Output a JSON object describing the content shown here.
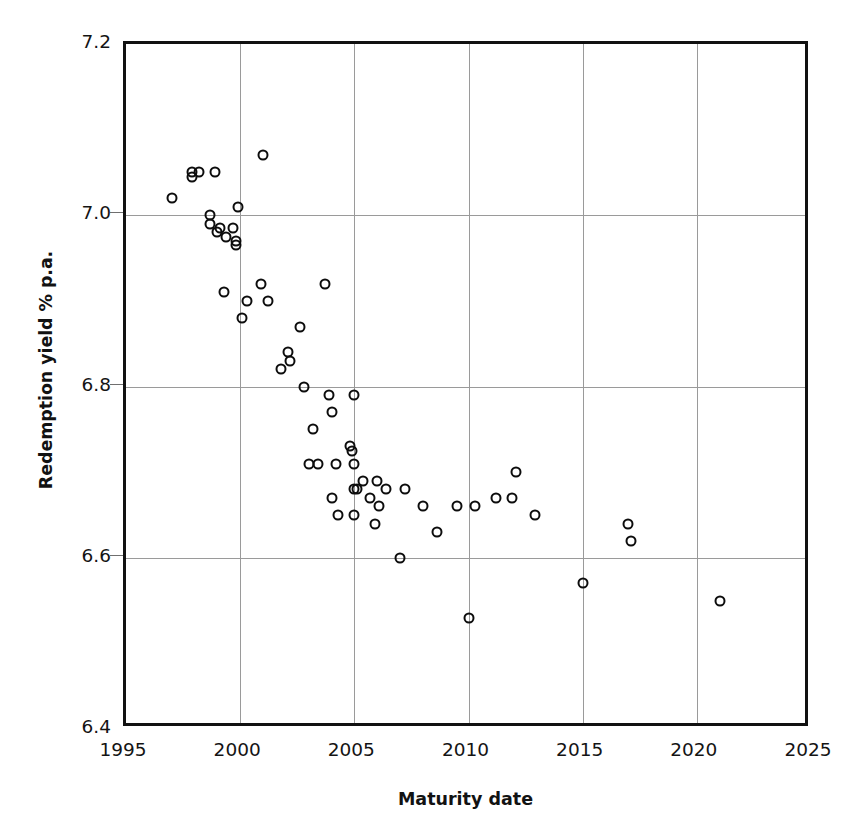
{
  "chart_data": {
    "type": "scatter",
    "title": "",
    "xlabel": "Maturity date",
    "ylabel": "Redemption yield % p.a.",
    "xlim": [
      1995,
      2025
    ],
    "ylim": [
      6.4,
      7.2
    ],
    "xticks": [
      "1995",
      "2000",
      "2005",
      "2010",
      "2015",
      "2020",
      "2025"
    ],
    "yticks": [
      "7.2",
      "7.0",
      "6.8",
      "6.6",
      "6.4"
    ],
    "grid": true,
    "legend": "none",
    "marker": "open-circle",
    "marker_color": "#0d0d0d",
    "x": [
      1997.0,
      1997.9,
      1997.9,
      1998.2,
      1998.7,
      1998.7,
      1998.9,
      1999.0,
      1999.1,
      1999.3,
      1999.4,
      1999.7,
      1999.8,
      1999.8,
      1999.9,
      2000.1,
      2000.3,
      2000.9,
      2001.0,
      2001.2,
      2001.8,
      2002.1,
      2002.2,
      2002.6,
      2002.8,
      2003.0,
      2003.2,
      2003.4,
      2003.7,
      2003.9,
      2004.0,
      2004.0,
      2004.2,
      2004.3,
      2004.8,
      2004.9,
      2005.0,
      2005.0,
      2005.0,
      2005.0,
      2005.1,
      2005.4,
      2005.7,
      2005.9,
      2006.0,
      2006.1,
      2006.4,
      2007.0,
      2007.2,
      2008.0,
      2008.6,
      2009.5,
      2010.0,
      2010.3,
      2011.2,
      2011.9,
      2012.1,
      2012.9,
      2015.0,
      2017.0,
      2017.1,
      2021.0
    ],
    "y": [
      7.02,
      7.05,
      7.045,
      7.05,
      7.0,
      6.99,
      7.05,
      6.98,
      6.985,
      6.91,
      6.975,
      6.985,
      6.97,
      6.965,
      7.01,
      6.88,
      6.9,
      6.92,
      7.07,
      6.9,
      6.82,
      6.84,
      6.83,
      6.87,
      6.8,
      6.71,
      6.75,
      6.71,
      6.92,
      6.79,
      6.77,
      6.67,
      6.71,
      6.65,
      6.73,
      6.725,
      6.79,
      6.71,
      6.68,
      6.65,
      6.68,
      6.69,
      6.67,
      6.64,
      6.69,
      6.66,
      6.68,
      6.6,
      6.68,
      6.66,
      6.63,
      6.66,
      6.53,
      6.66,
      6.67,
      6.67,
      6.7,
      6.65,
      6.57,
      6.64,
      6.62,
      6.55
    ]
  }
}
